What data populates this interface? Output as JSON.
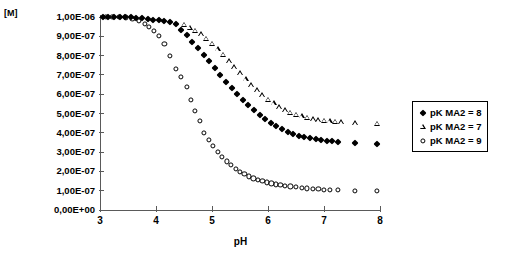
{
  "axes": {
    "y_unit_label": "[M]",
    "x_title": "pH",
    "y_ticks": [
      "1,00E-06",
      "9,00E-07",
      "8,00E-07",
      "7,00E-07",
      "6,00E-07",
      "5,00E-07",
      "4,00E-07",
      "3,00E-07",
      "2,00E-07",
      "1,00E-07",
      "0,00E+00"
    ],
    "x_ticks": [
      "3",
      "4",
      "5",
      "6",
      "7",
      "8"
    ]
  },
  "legend": {
    "entries": [
      {
        "marker": "filled-diamond",
        "label": "pK MA2 = 8"
      },
      {
        "marker": "open-triangle",
        "label": "pK MA2 = 7"
      },
      {
        "marker": "open-circle",
        "label": "pK MA2 = 9"
      }
    ]
  },
  "chart_data": {
    "type": "scatter",
    "title": "",
    "xlabel": "pH",
    "ylabel": "[M]",
    "xlim": [
      3,
      8
    ],
    "ylim": [
      0,
      1e-06
    ],
    "grid": false,
    "legend_position": "right",
    "y_tick_values": [
      1e-06,
      9e-07,
      8e-07,
      7e-07,
      6e-07,
      5e-07,
      4e-07,
      3e-07,
      2e-07,
      1e-07,
      0
    ],
    "x_tick_values": [
      3,
      4,
      5,
      6,
      7,
      8
    ],
    "series": [
      {
        "name": "pK MA2 = 8",
        "marker": "filled-diamond",
        "color": "#000000",
        "x": [
          3.05,
          3.15,
          3.25,
          3.35,
          3.45,
          3.55,
          3.65,
          3.75,
          3.85,
          3.95,
          4.05,
          4.15,
          4.25,
          4.35,
          4.45,
          4.55,
          4.65,
          4.75,
          4.85,
          4.95,
          5.05,
          5.15,
          5.25,
          5.35,
          5.45,
          5.55,
          5.65,
          5.75,
          5.85,
          5.95,
          6.05,
          6.15,
          6.25,
          6.35,
          6.45,
          6.55,
          6.65,
          6.75,
          6.85,
          6.95,
          7.05,
          7.15,
          7.25,
          7.55,
          7.95
        ],
        "y": [
          1e-06,
          1e-06,
          1e-06,
          1e-06,
          1e-06,
          9.98e-07,
          9.96e-07,
          9.94e-07,
          9.9e-07,
          9.86e-07,
          9.82e-07,
          9.78e-07,
          9.72e-07,
          9.64e-07,
          9.35e-07,
          9.05e-07,
          8.72e-07,
          8.4e-07,
          8.05e-07,
          7.7e-07,
          7.35e-07,
          7e-07,
          6.65e-07,
          6.32e-07,
          6e-07,
          5.7e-07,
          5.42e-07,
          5.16e-07,
          4.92e-07,
          4.7e-07,
          4.5e-07,
          4.33e-07,
          4.18e-07,
          4.05e-07,
          3.94e-07,
          3.85e-07,
          3.77e-07,
          3.71e-07,
          3.66e-07,
          3.62e-07,
          3.58e-07,
          3.55e-07,
          3.52e-07,
          3.48e-07,
          3.44e-07
        ]
      },
      {
        "name": "pK MA2 = 7",
        "marker": "open-triangle",
        "color": "#000000",
        "x": [
          4.5,
          4.6,
          4.7,
          4.8,
          4.9,
          5.0,
          5.1,
          5.2,
          5.3,
          5.4,
          5.5,
          5.6,
          5.7,
          5.8,
          5.9,
          6.0,
          6.1,
          6.2,
          6.3,
          6.4,
          6.5,
          6.6,
          6.7,
          6.8,
          6.9,
          7.0,
          7.1,
          7.2,
          7.3,
          7.55,
          7.95
        ],
        "y": [
          9.6e-07,
          9.45e-07,
          9.3e-07,
          9.1e-07,
          8.88e-07,
          8.62e-07,
          8.35e-07,
          8.05e-07,
          7.72e-07,
          7.4e-07,
          7.08e-07,
          6.78e-07,
          6.48e-07,
          6.2e-07,
          5.95e-07,
          5.72e-07,
          5.52e-07,
          5.34e-07,
          5.18e-07,
          5.05e-07,
          4.94e-07,
          4.85e-07,
          4.78e-07,
          4.72e-07,
          4.67e-07,
          4.63e-07,
          4.6e-07,
          4.57e-07,
          4.55e-07,
          4.5e-07,
          4.48e-07
        ]
      },
      {
        "name": "pK MA2 = 9",
        "marker": "open-circle",
        "color": "#000000",
        "x": [
          3.1,
          3.22,
          3.34,
          3.46,
          3.58,
          3.7,
          3.8,
          3.88,
          3.96,
          4.05,
          4.15,
          4.25,
          4.35,
          4.45,
          4.55,
          4.62,
          4.7,
          4.78,
          4.86,
          4.94,
          5.02,
          5.1,
          5.18,
          5.26,
          5.34,
          5.42,
          5.5,
          5.58,
          5.66,
          5.74,
          5.82,
          5.9,
          5.98,
          6.06,
          6.14,
          6.22,
          6.3,
          6.4,
          6.5,
          6.6,
          6.7,
          6.8,
          6.9,
          7.0,
          7.1,
          7.25,
          7.55,
          7.95
        ],
        "y": [
          1e-06,
          1e-06,
          1e-06,
          9.98e-07,
          9.92e-07,
          9.8e-07,
          9.65e-07,
          9.48e-07,
          9.3e-07,
          9.02e-07,
          8.62e-07,
          8e-07,
          7.3e-07,
          6.9e-07,
          6.38e-07,
          5.72e-07,
          5.12e-07,
          4.62e-07,
          4e-07,
          3.62e-07,
          3.3e-07,
          3e-07,
          2.74e-07,
          2.52e-07,
          2.32e-07,
          2.14e-07,
          1.98e-07,
          1.85e-07,
          1.74e-07,
          1.64e-07,
          1.56e-07,
          1.49e-07,
          1.43e-07,
          1.38e-07,
          1.33e-07,
          1.29e-07,
          1.26e-07,
          1.22e-07,
          1.18e-07,
          1.15e-07,
          1.12e-07,
          1.1e-07,
          1.08e-07,
          1.06e-07,
          1.05e-07,
          1.03e-07,
          1e-07,
          1e-07
        ]
      }
    ]
  }
}
